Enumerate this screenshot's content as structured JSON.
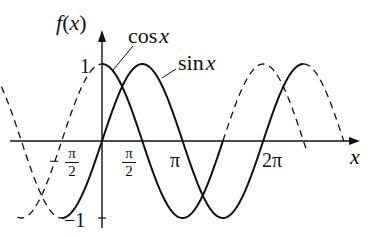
{
  "axes": {
    "y_label": "f(x)",
    "x_label": "x",
    "y_ticks": [
      {
        "value": 1,
        "label": "1"
      },
      {
        "value": -1,
        "label": "−1"
      }
    ],
    "x_ticks": [
      {
        "value": "-π/2",
        "sign": "−",
        "num": "π",
        "den": "2"
      },
      {
        "value": "π/2",
        "num": "π",
        "den": "2"
      },
      {
        "value": "π",
        "label": "π"
      },
      {
        "value": "2π",
        "label": "2π"
      }
    ]
  },
  "curves": [
    {
      "name": "cos x",
      "label": "cos x",
      "style": "solid segment on [0, 2π]-ish, dashed elsewhere"
    },
    {
      "name": "sin x",
      "label": "sin x",
      "style": "solid on [−π/2, 2π+π/2], dashed elsewhere"
    }
  ],
  "labels": {
    "cos": "cos",
    "sin": "sin",
    "var": "x"
  },
  "colors": {
    "line": "#111111",
    "background": "#ffffff"
  }
}
